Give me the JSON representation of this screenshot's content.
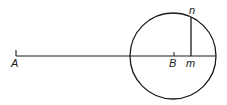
{
  "diagram": {
    "labels": {
      "A": "A",
      "B": "B",
      "m": "m",
      "n": "n"
    },
    "colors": {
      "stroke": "#1a1a1a",
      "background": "#ffffff"
    },
    "geometry": {
      "circle": {
        "cx": 173,
        "cy": 56,
        "r": 43
      },
      "baseline": {
        "x1": 16,
        "y1": 56,
        "x2": 216,
        "y2": 56
      },
      "tick_A": {
        "x": 16,
        "y1": 50,
        "y2": 56
      },
      "tick_B": {
        "x": 174,
        "y1": 52,
        "y2": 56
      },
      "perpendicular_mn": {
        "x": 191,
        "y1": 17,
        "y2": 56
      }
    }
  }
}
